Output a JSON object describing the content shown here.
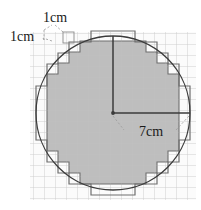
{
  "figure": {
    "name": "circle-area-grid-approximation",
    "labels": {
      "unit_top": "1cm",
      "unit_left": "1cm",
      "radius": "7cm"
    },
    "colors": {
      "grid_line": "#c9c9c9",
      "grid_line_major": "#bdbdbd",
      "circle_stroke": "#3b3b3b",
      "outer_polygon_stroke": "#6e6e6e",
      "inner_polygon_fill": "#b9b9b9",
      "inner_polygon_stroke": "#6e6e6e",
      "radius_line": "#3b3b3b",
      "leader_line": "#9a9a9a",
      "text": "#1a1a1a"
    },
    "geometry": {
      "cell_px": 11,
      "grid_left": 30,
      "grid_top": 32,
      "grid_right": 196,
      "grid_bottom": 200,
      "center_x": 113,
      "center_y": 113,
      "radius_px": 77,
      "radius_cells": 7,
      "unit_label": "cm"
    },
    "inner_polygon_points": "80,41 146,41 146,52 157,52 157,63 168,63 168,74 179,74 179,151 168,151 168,162 157,162 157,173 146,173 146,184 80,184 80,173 69,173 69,162 58,162 58,151 47,151 47,74 58,74 58,63 69,63 69,52 80,52",
    "outer_polygon_points": "91,31 135,31 135,42 157,42 157,53 168,53 168,64 179,64 179,86 190,86 190,140 179,140 179,162 168,162 168,173 157,173 157,184 135,184 135,195 91,195 91,184 69,184 69,173 58,173 58,162 47,162 47,140 36,140 36,86 47,86 47,64 58,64 58,53 69,53 69,42 91,42",
    "radius_lines": [
      {
        "name": "vertical-radius",
        "x1": 113,
        "y1": 113,
        "x2": 113,
        "y2": 36
      },
      {
        "name": "horizontal-radius",
        "x1": 113,
        "y1": 113,
        "x2": 190,
        "y2": 113
      }
    ],
    "leaders": {
      "unit_top": [
        [
          64,
          31
        ],
        [
          52,
          27
        ]
      ],
      "unit_left": [
        [
          53,
          40
        ],
        [
          42,
          38
        ]
      ],
      "radius_left": [
        [
          113,
          116
        ],
        [
          124,
          130
        ]
      ],
      "radius_right": [
        [
          189,
          116
        ],
        [
          176,
          130
        ]
      ]
    }
  }
}
